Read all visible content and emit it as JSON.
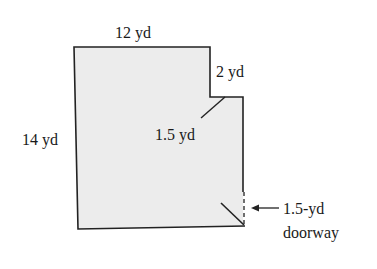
{
  "diagram": {
    "type": "floor-plan",
    "fill_color": "#ececec",
    "stroke_color": "#222222",
    "labels": {
      "top": "12 yd",
      "notch": "2 yd",
      "left": "14 yd",
      "inner": "1.5 yd",
      "doorway_line1": "1.5-yd",
      "doorway_line2": "doorway"
    }
  }
}
